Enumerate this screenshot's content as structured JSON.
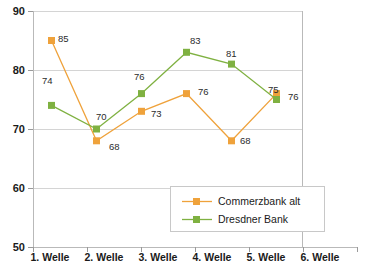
{
  "chart_data": {
    "type": "line",
    "title": "",
    "subtitle": "",
    "xlabel": "",
    "ylabel": "",
    "categories": [
      "1. Welle",
      "2. Welle",
      "3. Welle",
      "4. Welle",
      "5. Welle",
      "6. Welle"
    ],
    "series": [
      {
        "name": "Commerzbank alt",
        "color": "#EFA23B",
        "marker": "square",
        "values": [
          85,
          68,
          73,
          76,
          68,
          76
        ]
      },
      {
        "name": "Dresdner Bank",
        "color": "#7FB141",
        "marker": "square",
        "values": [
          74,
          70,
          76,
          83,
          81,
          75
        ]
      }
    ],
    "ylim": [
      50,
      90
    ],
    "yticks": [
      50,
      60,
      70,
      80,
      90
    ],
    "ytick_labels": [
      "50",
      "60",
      "70",
      "80",
      "90"
    ],
    "grid": true,
    "grid_axis": "y",
    "legend_position": "bottom-right",
    "data_labels": true
  },
  "axes": {
    "y": {
      "ticks": [
        {
          "value": 90,
          "label": "90"
        },
        {
          "value": 80,
          "label": "80"
        },
        {
          "value": 70,
          "label": "70"
        },
        {
          "value": 60,
          "label": "60"
        },
        {
          "value": 50,
          "label": "50"
        }
      ]
    },
    "x": {
      "ticks": [
        {
          "label": "1. Welle"
        },
        {
          "label": "2. Welle"
        },
        {
          "label": "3. Welle"
        },
        {
          "label": "4. Welle"
        },
        {
          "label": "5. Welle"
        },
        {
          "label": "6. Welle"
        }
      ]
    }
  },
  "point_labels": {
    "commerzbank": [
      "85",
      "68",
      "73",
      "76",
      "68",
      "76"
    ],
    "dresdner": [
      "74",
      "70",
      "76",
      "83",
      "81",
      "75"
    ]
  },
  "legend": {
    "items": [
      {
        "label": "Commerzbank alt",
        "color": "#EFA23B"
      },
      {
        "label": "Dresdner Bank",
        "color": "#7FB141"
      }
    ]
  },
  "colors": {
    "commerzbank": "#EFA23B",
    "dresdner": "#7FB141",
    "grid": "#d4d4d4",
    "text": "#1a1a1a"
  }
}
